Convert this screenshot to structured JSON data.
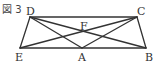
{
  "figure": {
    "title": "図 3",
    "stroke_color": "#333333",
    "labels": {
      "D": "D",
      "C": "C",
      "E": "E",
      "A": "A",
      "B": "B",
      "F": "F"
    },
    "points": {
      "D": [
        30,
        17
      ],
      "C": [
        137,
        17
      ],
      "E": [
        20,
        48
      ],
      "A": [
        82,
        48
      ],
      "B": [
        146,
        48
      ],
      "F": [
        83,
        32
      ]
    },
    "segments": [
      [
        "D",
        "C"
      ],
      [
        "E",
        "B"
      ],
      [
        "D",
        "E"
      ],
      [
        "C",
        "B"
      ],
      [
        "D",
        "A"
      ],
      [
        "C",
        "A"
      ],
      [
        "D",
        "B"
      ],
      [
        "E",
        "C"
      ]
    ]
  }
}
